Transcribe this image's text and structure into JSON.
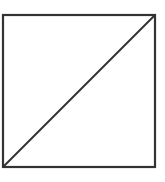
{
  "diagram": {
    "type": "square-with-diagonal",
    "shapes": [
      {
        "kind": "square",
        "x": 3,
        "y": 15,
        "width": 152,
        "height": 152
      },
      {
        "kind": "diagonal",
        "from": "bottom-left",
        "to": "top-right"
      }
    ],
    "stroke_color": "#333333",
    "stroke_width": 2,
    "background": "#ffffff"
  }
}
